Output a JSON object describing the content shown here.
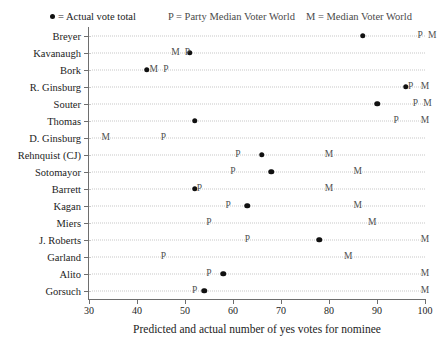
{
  "legend": {
    "dot_symbol": "dot-glyph",
    "dot_label": "= Actual vote total",
    "p_label": "P = Party Median Voter World",
    "m_label": "M = Median Voter World"
  },
  "chart_data": {
    "type": "scatter",
    "title": "",
    "xlabel": "Predicted and actual number of yes votes for nominee",
    "ylabel": "",
    "xlim": [
      30,
      100
    ],
    "xticks": [
      30,
      40,
      50,
      60,
      70,
      80,
      90,
      100
    ],
    "grid": true,
    "legend_position": "top",
    "categories": [
      "Breyer",
      "Kavanaugh",
      "Bork",
      "R. Ginsburg",
      "Souter",
      "Thomas",
      "D. Ginsburg",
      "Rehnquist (CJ)",
      "Sotomayor",
      "Barrett",
      "Kagan",
      "Miers",
      "J. Roberts",
      "Garland",
      "Alito",
      "Gorsuch"
    ],
    "series": [
      {
        "name": "Actual vote total",
        "symbol": "dot",
        "values": [
          87,
          51,
          42,
          96,
          90,
          52,
          null,
          66,
          68,
          52,
          63,
          null,
          78,
          null,
          58,
          54
        ]
      },
      {
        "name": "Party Median Voter World",
        "symbol": "P",
        "values": [
          99,
          50.5,
          46,
          97,
          98,
          94,
          45.5,
          61,
          60,
          53,
          59,
          55,
          63,
          45.5,
          55,
          52
        ]
      },
      {
        "name": "Median Voter World",
        "symbol": "M",
        "values": [
          101.5,
          48,
          43.5,
          100,
          100.5,
          100,
          33.5,
          80,
          86,
          80,
          86,
          89,
          100,
          84,
          100,
          100
        ]
      }
    ]
  }
}
